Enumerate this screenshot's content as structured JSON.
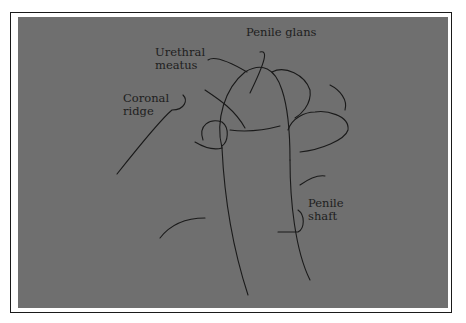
{
  "figure": {
    "background_color": "#6f6f6f",
    "line_color": "#1a1a1a",
    "labels": [
      {
        "id": "penile-glans",
        "text": "Penile glans",
        "x": 246,
        "y": 26
      },
      {
        "id": "urethral-meatus",
        "text": "Urethral\nmeatus",
        "x": 155,
        "y": 46
      },
      {
        "id": "coronal-ridge",
        "text": "Coronal\nridge",
        "x": 123,
        "y": 92
      },
      {
        "id": "penile-shaft",
        "text": "Penile\nshaft",
        "x": 308,
        "y": 197
      }
    ]
  }
}
